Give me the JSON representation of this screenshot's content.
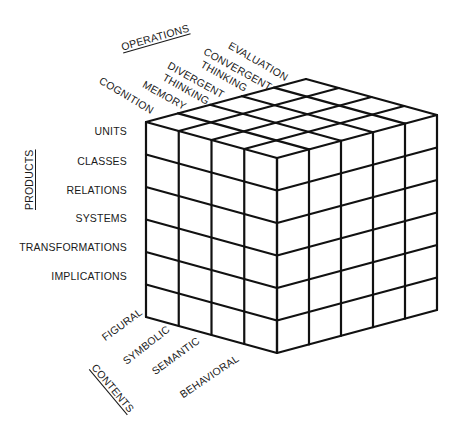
{
  "diagram": {
    "type": "structure-of-intellect-cube",
    "axes": {
      "operations": {
        "title": "OPERATIONS",
        "items": [
          {
            "label": "COGNITION"
          },
          {
            "label": "MEMORY"
          },
          {
            "label": "DIVERGENT",
            "label2": "THINKING"
          },
          {
            "label": "CONVERGENT",
            "label2": "THINKING"
          },
          {
            "label": "EVALUATION"
          }
        ]
      },
      "products": {
        "title": "PRODUCTS",
        "items": [
          "UNITS",
          "CLASSES",
          "RELATIONS",
          "SYSTEMS",
          "TRANSFORMATIONS",
          "IMPLICATIONS"
        ]
      },
      "contents": {
        "title": "CONTENTS",
        "items": [
          "FIGURAL",
          "SYMBOLIC",
          "SEMANTIC",
          "BEHAVIORAL"
        ]
      }
    },
    "cube": {
      "corner_left_top": [
        146,
        122
      ],
      "vector_contents": [
        131,
        36
      ],
      "vector_operations": [
        160,
        -43
      ],
      "height": 195,
      "contents_cells": 4,
      "operations_cells": 5,
      "products_cells": 6,
      "stroke_color": "#111111",
      "stroke_width": 2.2
    }
  }
}
